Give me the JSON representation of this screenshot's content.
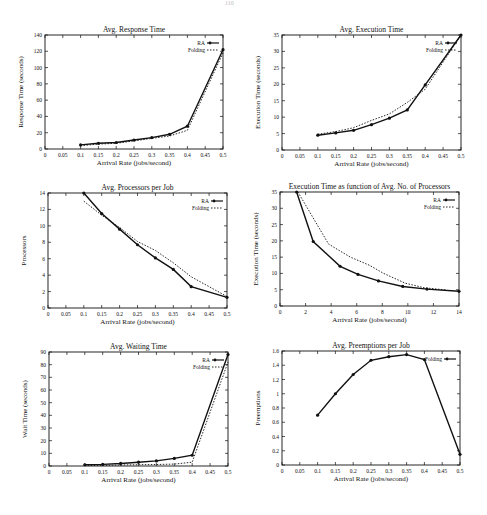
{
  "page": {
    "number": "110"
  },
  "chart_data": [
    {
      "id": "c1",
      "type": "line",
      "title": "Avg. Response Time",
      "xlabel": "Arrival Rate (jobs/second)",
      "ylabel": "Response Time (seconds)",
      "xlim": [
        0,
        0.5
      ],
      "ylim": [
        0,
        140
      ],
      "xticks": [
        "0",
        "0.05",
        "0.1",
        "0.15",
        "0.2",
        "0.25",
        "0.3",
        "0.35",
        "0.4",
        "0.45",
        "0.5"
      ],
      "yticks": [
        "0",
        "20",
        "40",
        "60",
        "80",
        "100",
        "120",
        "140"
      ],
      "legend": {
        "position": "top-right",
        "entries": [
          "RA",
          "Folding"
        ]
      },
      "grid": false,
      "x": [
        0.1,
        0.15,
        0.2,
        0.25,
        0.3,
        0.35,
        0.4,
        0.5
      ],
      "series": [
        {
          "name": "RA",
          "style": "solid-marker",
          "values": [
            5,
            7,
            8,
            11,
            14,
            18,
            28,
            122
          ]
        },
        {
          "name": "Folding",
          "style": "dotted",
          "values": [
            4,
            6,
            7,
            10,
            13,
            16,
            23,
            118
          ]
        }
      ],
      "box": {
        "left": 45,
        "top": 35,
        "right": 223,
        "bottom": 149
      }
    },
    {
      "id": "c2",
      "type": "line",
      "title": "Avg. Execution Time",
      "xlabel": "Arrival Rate (jobs/second)",
      "ylabel": "Execution Time (seconds)",
      "xlim": [
        0,
        0.5
      ],
      "ylim": [
        0,
        35
      ],
      "xticks": [
        "0",
        "0.05",
        "0.1",
        "0.15",
        "0.2",
        "0.25",
        "0.3",
        "0.35",
        "0.4",
        "0.45",
        "0.5"
      ],
      "yticks": [
        "0",
        "5",
        "10",
        "15",
        "20",
        "25",
        "30",
        "35"
      ],
      "legend": {
        "position": "top-right",
        "entries": [
          "RA",
          "Folding"
        ]
      },
      "grid": false,
      "x": [
        0.1,
        0.15,
        0.2,
        0.25,
        0.3,
        0.35,
        0.4,
        0.5
      ],
      "series": [
        {
          "name": "RA",
          "style": "solid-marker",
          "values": [
            4.5,
            5.2,
            6,
            7.7,
            9.7,
            12.2,
            19.8,
            35
          ]
        },
        {
          "name": "Folding",
          "style": "dotted",
          "values": [
            4.8,
            5.6,
            6.8,
            9,
            11,
            14.5,
            18.5,
            35
          ]
        }
      ],
      "box": {
        "left": 282,
        "top": 35,
        "right": 461,
        "bottom": 150
      }
    },
    {
      "id": "c3",
      "type": "line",
      "title": "Avg. Processors per Job",
      "xlabel": "Arrival Rate (jobs/second)",
      "ylabel": "Processors",
      "xlim": [
        0,
        0.5
      ],
      "ylim": [
        0,
        14
      ],
      "xticks": [
        "0",
        "0.05",
        "0.1",
        "0.15",
        "0.2",
        "0.25",
        "0.3",
        "0.35",
        "0.4",
        "0.45",
        "0.5"
      ],
      "yticks": [
        "0",
        "2",
        "4",
        "6",
        "8",
        "10",
        "12",
        "14"
      ],
      "legend": {
        "position": "top-right",
        "entries": [
          "RA",
          "Folding"
        ]
      },
      "grid": false,
      "x": [
        0.1,
        0.15,
        0.2,
        0.25,
        0.3,
        0.35,
        0.4,
        0.5
      ],
      "series": [
        {
          "name": "RA",
          "style": "solid-marker",
          "values": [
            14,
            11.5,
            9.6,
            7.7,
            6.1,
            4.7,
            2.6,
            1.3
          ]
        },
        {
          "name": "Folding",
          "style": "dotted",
          "values": [
            13,
            11.3,
            9.8,
            8.1,
            7,
            5.5,
            3.8,
            1.4
          ]
        }
      ],
      "box": {
        "left": 48,
        "top": 193,
        "right": 227,
        "bottom": 308
      }
    },
    {
      "id": "c4",
      "type": "line",
      "title": "Execution Time as function of Avg. No. of Processors",
      "xlabel": "Arrival Rate (jobs/second)",
      "ylabel": "Execution Time (seconds)",
      "xlim": [
        0,
        14
      ],
      "ylim": [
        0,
        35
      ],
      "xticks": [
        "0",
        "2",
        "4",
        "6",
        "8",
        "10",
        "12",
        "14"
      ],
      "yticks": [
        "0",
        "5",
        "10",
        "15",
        "20",
        "25",
        "30",
        "35"
      ],
      "legend": {
        "position": "top-right",
        "entries": [
          "RA",
          "Folding"
        ]
      },
      "grid": false,
      "series": [
        {
          "name": "RA",
          "style": "solid-marker",
          "x": [
            1.3,
            2.6,
            4.7,
            6.1,
            7.7,
            9.6,
            11.5,
            14
          ],
          "values": [
            35,
            19.8,
            12.2,
            9.7,
            7.7,
            6,
            5.2,
            4.5
          ]
        },
        {
          "name": "Folding",
          "style": "dotted",
          "x": [
            1.4,
            3.8,
            5.5,
            7,
            8.1,
            9.8,
            11.3,
            13
          ],
          "values": [
            35,
            19,
            15,
            12.5,
            10,
            7,
            5.6,
            4.9
          ]
        }
      ],
      "box": {
        "left": 280,
        "top": 192,
        "right": 459,
        "bottom": 306
      }
    },
    {
      "id": "c5",
      "type": "line",
      "title": "Avg. Waiting Time",
      "xlabel": "Arrival Rate (jobs/second)",
      "ylabel": "Wait Time (seconds)",
      "xlim": [
        0,
        0.5
      ],
      "ylim": [
        0,
        90
      ],
      "xticks": [
        "0",
        "0.05",
        "0.1",
        "0.15",
        "0.2",
        "0.25",
        "0.3",
        "0.35",
        "0.4",
        "0.45",
        "0.5"
      ],
      "yticks": [
        "0",
        "10",
        "20",
        "30",
        "40",
        "50",
        "60",
        "70",
        "80",
        "90"
      ],
      "legend": {
        "position": "top-right",
        "entries": [
          "RA",
          "Folding"
        ]
      },
      "grid": false,
      "x": [
        0.1,
        0.15,
        0.2,
        0.25,
        0.3,
        0.35,
        0.4,
        0.5
      ],
      "series": [
        {
          "name": "RA",
          "style": "solid-marker",
          "values": [
            1,
            1.3,
            2,
            3,
            4,
            6,
            8.5,
            88
          ]
        },
        {
          "name": "Folding",
          "style": "dotted",
          "values": [
            0.3,
            0.5,
            0.8,
            1,
            1.2,
            1.5,
            3,
            82
          ]
        }
      ],
      "box": {
        "left": 49,
        "top": 352,
        "right": 228,
        "bottom": 466
      }
    },
    {
      "id": "c6",
      "type": "line",
      "title": "Avg. Preemptions per Job",
      "xlabel": "Arrival Rate (jobs/second)",
      "ylabel": "Preemptions",
      "xlim": [
        0,
        0.5
      ],
      "ylim": [
        0,
        1.6
      ],
      "xticks": [
        "0",
        "0.05",
        "0.1",
        "0.15",
        "0.2",
        "0.25",
        "0.3",
        "0.35",
        "0.4",
        "0.45",
        "0.5"
      ],
      "yticks": [
        "0",
        "0.2",
        "0.4",
        "0.6",
        "0.8",
        "1",
        "1.2",
        "1.4",
        "1.6"
      ],
      "legend": {
        "position": "top-right",
        "entries": [
          "Folding"
        ]
      },
      "grid": false,
      "x": [
        0.1,
        0.15,
        0.2,
        0.25,
        0.3,
        0.35,
        0.4,
        0.5
      ],
      "series": [
        {
          "name": "Folding",
          "style": "solid-marker",
          "values": [
            0.7,
            1.0,
            1.27,
            1.47,
            1.52,
            1.55,
            1.48,
            0.15
          ]
        }
      ],
      "box": {
        "left": 282,
        "top": 351,
        "right": 460,
        "bottom": 465
      }
    }
  ]
}
